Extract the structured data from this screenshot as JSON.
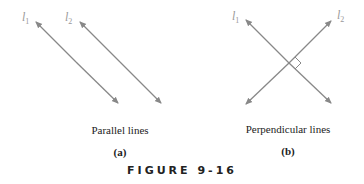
{
  "figure": {
    "title": "FIGURE 9-16",
    "panels": [
      {
        "caption": "Parallel lines",
        "label": "(a)",
        "line_labels": [
          "l",
          "l"
        ],
        "line_subs": [
          "1",
          "2"
        ]
      },
      {
        "caption": "Perpendicular lines",
        "label": "(b)",
        "line_labels": [
          "l",
          "l"
        ],
        "line_subs": [
          "1",
          "2"
        ]
      }
    ],
    "colors": {
      "line": "#888888",
      "label": "#999999",
      "text": "#222222"
    }
  }
}
